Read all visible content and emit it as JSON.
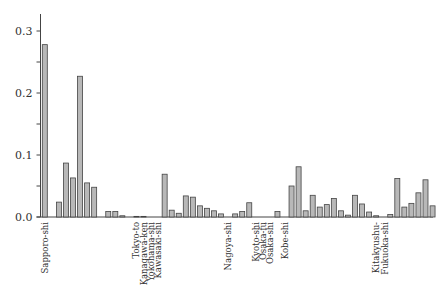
{
  "chart_data": {
    "type": "bar",
    "title": "",
    "xlabel": "",
    "ylabel": "",
    "ylim": [
      0,
      0.32
    ],
    "yticks": [
      0.0,
      0.1,
      0.2,
      0.3
    ],
    "yticks_minor": [
      0.05,
      0.15,
      0.25
    ],
    "ytick_labels": [
      "0.0",
      "0.1",
      "0.2",
      "0.3"
    ],
    "grid": false,
    "legend": null,
    "bar_color": "#b8b8b8",
    "bar_edge_color": "#444444",
    "values": [
      0.278,
      0.0,
      0.024,
      0.087,
      0.063,
      0.227,
      0.055,
      0.048,
      0.0,
      0.009,
      0.009,
      0.002,
      0.0,
      0.001,
      0.001,
      0.0,
      0.0,
      0.069,
      0.011,
      0.006,
      0.034,
      0.032,
      0.018,
      0.014,
      0.01,
      0.005,
      0.0,
      0.005,
      0.009,
      0.023,
      0.0,
      0.0,
      0.0,
      0.009,
      0.0,
      0.05,
      0.081,
      0.01,
      0.035,
      0.016,
      0.02,
      0.03,
      0.01,
      0.003,
      0.035,
      0.021,
      0.008,
      0.002,
      0.0,
      0.004,
      0.062,
      0.016,
      0.022,
      0.039,
      0.06,
      0.018
    ],
    "labeled_categories": [
      {
        "index": 0,
        "label": "Sapporo-shi"
      },
      {
        "index": 13,
        "label": "Tokyo-to"
      },
      {
        "index": 14,
        "label": "Kanagawa-ken"
      },
      {
        "index": 15,
        "label": "Yokohama-shi"
      },
      {
        "index": 16,
        "label": "Kawasaki-shi"
      },
      {
        "index": 26,
        "label": "Nagoya-shi"
      },
      {
        "index": 30,
        "label": "Kyoto-shi"
      },
      {
        "index": 31,
        "label": "Osaka-fu"
      },
      {
        "index": 32,
        "label": "Osaka-shi"
      },
      {
        "index": 34,
        "label": "Kobe-shi"
      },
      {
        "index": 47,
        "label": "Kitakyushu-",
        "label2": "Fukuoka-shi"
      }
    ]
  }
}
